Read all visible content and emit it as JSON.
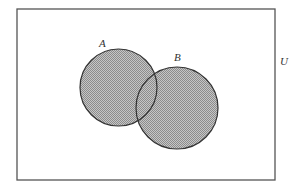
{
  "diagram": {
    "type": "venn",
    "universe": {
      "label": "U",
      "x": 17,
      "y": 9,
      "width": 258,
      "height": 171
    },
    "sets": [
      {
        "id": "A",
        "label": "A",
        "cx": 118.5,
        "cy": 87.5,
        "r": 38.5,
        "label_x": 99,
        "label_y": 47
      },
      {
        "id": "B",
        "label": "B",
        "cx": 177,
        "cy": 108,
        "r": 41,
        "label_x": 174,
        "label_y": 61
      }
    ],
    "shaded": "A ∪ B"
  },
  "colors": {
    "stroke": "#333333",
    "fill_dark": "#8c8c8c",
    "fill_light": "#c6c6c6",
    "border": "#555555"
  }
}
